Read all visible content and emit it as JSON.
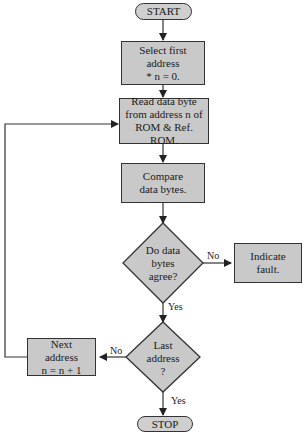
{
  "flowchart": {
    "start": "START",
    "stop": "STOP",
    "select_first": "Select first\naddress\n* n = 0.",
    "read_byte": "Read data byte\nfrom address n of\nROM & Ref. ROM.",
    "compare": "Compare\ndata bytes.",
    "agree_decision": "Do data\nbytes\nagree?",
    "indicate_fault": "Indicate\nfault.",
    "last_decision": "Last\naddress\n?",
    "next_address": "Next\naddress\nn = n + 1",
    "labels": {
      "agree_no": "No",
      "agree_yes": "Yes",
      "last_no": "No",
      "last_yes": "Yes"
    }
  },
  "colors": {
    "fill": "#c9c9c9",
    "stroke": "#333333"
  }
}
